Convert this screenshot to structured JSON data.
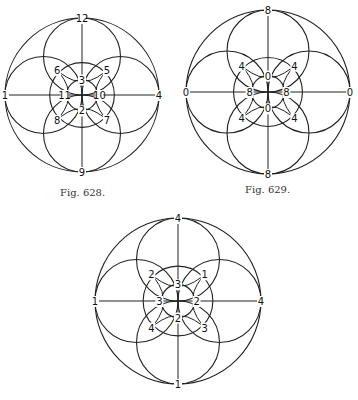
{
  "figures": [
    {
      "id": "fig628",
      "caption": "Fig. 628.",
      "center": [
        82,
        95
      ],
      "radius": 77,
      "labels": {
        "top": "12",
        "bottom": "9",
        "left": "1",
        "right": "4",
        "upper_left": "6",
        "upper_right": "5",
        "lower_left": "8",
        "lower_right": "7",
        "inner_top": "3",
        "inner_bottom": "2",
        "inner_left": "11",
        "inner_right": "10"
      }
    },
    {
      "id": "fig629",
      "caption": "Fig. 629.",
      "center": [
        268,
        92
      ],
      "radius": 82,
      "labels": {
        "top": "8",
        "bottom": "8",
        "left": "0",
        "right": "0",
        "upper_left": "4",
        "upper_right": "4",
        "lower_left": "4",
        "lower_right": "4",
        "inner_top": "0",
        "inner_bottom": "0",
        "inner_left": "8",
        "inner_right": "8"
      }
    },
    {
      "id": "fig630",
      "caption": "",
      "center": [
        178,
        301
      ],
      "radius": 83,
      "labels": {
        "top": "4",
        "bottom": "1",
        "left": "1",
        "right": "4",
        "upper_left": "2",
        "upper_right": "1",
        "lower_left": "4",
        "lower_right": "3",
        "inner_top": "3",
        "inner_bottom": "2",
        "inner_left": "3",
        "inner_right": "2"
      }
    }
  ],
  "stroke_color": "#222222"
}
